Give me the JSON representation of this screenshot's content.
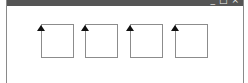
{
  "window": {
    "controls": {
      "minimize": "_",
      "maximize": "□",
      "close": "×"
    },
    "titlebar_color": "#555555"
  },
  "boxes": [
    {
      "id": 1,
      "left": 34,
      "icon": "up-arrow-icon"
    },
    {
      "id": 2,
      "left": 78,
      "icon": "up-arrow-icon"
    },
    {
      "id": 3,
      "left": 123,
      "icon": "up-arrow-icon"
    },
    {
      "id": 4,
      "left": 168,
      "icon": "up-arrow-icon"
    }
  ]
}
